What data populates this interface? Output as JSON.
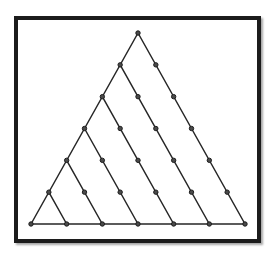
{
  "diagram": {
    "rows": 7,
    "colors": {
      "frame": "#1c1c1c",
      "line": "#262626",
      "node_fill": "#4a4a4a",
      "node_stroke": "#1e1e1e",
      "background": "#ffffff"
    },
    "node_count": 28,
    "edges": {
      "left_side": "from apex (row 1) to bottom-left (row 7, position 1)",
      "bottom_side": "row 7, position 1 to row 7, position 7",
      "descending_lines": [
        {
          "from": [
            1,
            1
          ],
          "to": [
            7,
            7
          ]
        },
        {
          "from": [
            2,
            1
          ],
          "to": [
            7,
            6
          ]
        },
        {
          "from": [
            3,
            1
          ],
          "to": [
            7,
            5
          ]
        },
        {
          "from": [
            4,
            1
          ],
          "to": [
            7,
            4
          ]
        },
        {
          "from": [
            5,
            1
          ],
          "to": [
            7,
            3
          ]
        },
        {
          "from": [
            6,
            1
          ],
          "to": [
            7,
            2
          ]
        }
      ]
    }
  }
}
